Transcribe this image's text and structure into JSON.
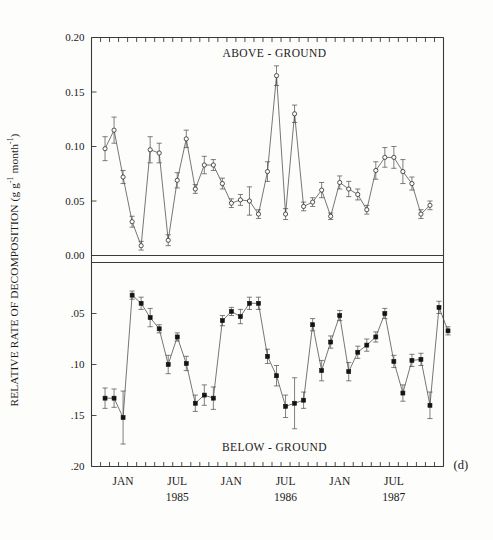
{
  "figure": {
    "panel_label": "(d)",
    "y_axis_title_main": "RELATIVE RATE OF DECOMPOSITION (g g",
    "y_axis_title_sup1": "-1",
    "y_axis_title_mid": " month",
    "y_axis_title_sup2": "-1",
    "y_axis_title_end": ")"
  },
  "chart_data": {
    "type": "line",
    "title": "",
    "xlabel": "",
    "ylabel": "RELATIVE RATE OF DECOMPOSITION (g g-1 month-1)",
    "grid": false,
    "legend": "none",
    "x_axis": {
      "tick_interval": "month",
      "start": "1984-10",
      "end": "1987-12",
      "labeled_ticks": [
        {
          "label": "JAN",
          "date": "1985-01"
        },
        {
          "label": "JUL",
          "date": "1985-07"
        },
        {
          "label": "JAN",
          "date": "1986-01"
        },
        {
          "label": "JUL",
          "date": "1986-07"
        },
        {
          "label": "JAN",
          "date": "1987-01"
        },
        {
          "label": "JUL",
          "date": "1987-07"
        }
      ],
      "year_labels": [
        {
          "label": "1985",
          "date": "1985-07"
        },
        {
          "label": "1986",
          "date": "1986-07"
        },
        {
          "label": "1987",
          "date": "1987-07"
        }
      ]
    },
    "panels": [
      {
        "name": "above-ground",
        "title": "ABOVE - GROUND",
        "marker": "open-circle",
        "ylim": [
          0.0,
          0.2
        ],
        "direction": "up",
        "ytick_labels": [
          "0.00",
          "0.05",
          "0.10",
          "0.15",
          "0.20"
        ],
        "ytick_values": [
          0.0,
          0.05,
          0.1,
          0.15,
          0.2
        ],
        "points": [
          {
            "x": "1984-11",
            "y": 0.098,
            "err": 0.011
          },
          {
            "x": "1984-12",
            "y": 0.115,
            "err": 0.012
          },
          {
            "x": "1985-01",
            "y": 0.072,
            "err": 0.006
          },
          {
            "x": "1985-02",
            "y": 0.031,
            "err": 0.005
          },
          {
            "x": "1985-03",
            "y": 0.009,
            "err": 0.004
          },
          {
            "x": "1985-04",
            "y": 0.097,
            "err": 0.012
          },
          {
            "x": "1985-05",
            "y": 0.094,
            "err": 0.009
          },
          {
            "x": "1985-06",
            "y": 0.014,
            "err": 0.005
          },
          {
            "x": "1985-07",
            "y": 0.069,
            "err": 0.007
          },
          {
            "x": "1985-08",
            "y": 0.107,
            "err": 0.008
          },
          {
            "x": "1985-09",
            "y": 0.061,
            "err": 0.004
          },
          {
            "x": "1985-10",
            "y": 0.083,
            "err": 0.008
          },
          {
            "x": "1985-11",
            "y": 0.083,
            "err": 0.005
          },
          {
            "x": "1985-12",
            "y": 0.066,
            "err": 0.005
          },
          {
            "x": "1986-01",
            "y": 0.048,
            "err": 0.004
          },
          {
            "x": "1986-02",
            "y": 0.051,
            "err": 0.005
          },
          {
            "x": "1986-03",
            "y": 0.05,
            "err": 0.013
          },
          {
            "x": "1986-04",
            "y": 0.038,
            "err": 0.004
          },
          {
            "x": "1986-05",
            "y": 0.077,
            "err": 0.009
          },
          {
            "x": "1986-06",
            "y": 0.165,
            "err": 0.009
          },
          {
            "x": "1986-07",
            "y": 0.038,
            "err": 0.005
          },
          {
            "x": "1986-08",
            "y": 0.13,
            "err": 0.008
          },
          {
            "x": "1986-09",
            "y": 0.045,
            "err": 0.004
          },
          {
            "x": "1986-10",
            "y": 0.049,
            "err": 0.004
          },
          {
            "x": "1986-11",
            "y": 0.06,
            "err": 0.007
          },
          {
            "x": "1986-12",
            "y": 0.036,
            "err": 0.003
          },
          {
            "x": "1987-01",
            "y": 0.067,
            "err": 0.006
          },
          {
            "x": "1987-02",
            "y": 0.061,
            "err": 0.007
          },
          {
            "x": "1987-03",
            "y": 0.056,
            "err": 0.005
          },
          {
            "x": "1987-04",
            "y": 0.042,
            "err": 0.004
          },
          {
            "x": "1987-05",
            "y": 0.078,
            "err": 0.008
          },
          {
            "x": "1987-06",
            "y": 0.09,
            "err": 0.009
          },
          {
            "x": "1987-07",
            "y": 0.09,
            "err": 0.01
          },
          {
            "x": "1987-08",
            "y": 0.077,
            "err": 0.011
          },
          {
            "x": "1987-09",
            "y": 0.066,
            "err": 0.006
          },
          {
            "x": "1987-10",
            "y": 0.038,
            "err": 0.004
          },
          {
            "x": "1987-11",
            "y": 0.046,
            "err": 0.004
          }
        ]
      },
      {
        "name": "below-ground",
        "title": "BELOW - GROUND",
        "marker": "filled-square",
        "ylim": [
          0.0,
          0.2
        ],
        "direction": "down",
        "ytick_labels": [
          "0.00",
          ".05",
          ".10",
          ".15",
          ".20"
        ],
        "ytick_values": [
          0.0,
          0.05,
          0.1,
          0.15,
          0.2
        ],
        "points": [
          {
            "x": "1984-11",
            "y": 0.133,
            "err": 0.01
          },
          {
            "x": "1984-12",
            "y": 0.133,
            "err": 0.009
          },
          {
            "x": "1985-01",
            "y": 0.152,
            "err": 0.026
          },
          {
            "x": "1985-02",
            "y": 0.032,
            "err": 0.004
          },
          {
            "x": "1985-03",
            "y": 0.04,
            "err": 0.006
          },
          {
            "x": "1985-04",
            "y": 0.054,
            "err": 0.009
          },
          {
            "x": "1985-05",
            "y": 0.065,
            "err": 0.004
          },
          {
            "x": "1985-06",
            "y": 0.1,
            "err": 0.009
          },
          {
            "x": "1985-07",
            "y": 0.073,
            "err": 0.004
          },
          {
            "x": "1985-08",
            "y": 0.099,
            "err": 0.007
          },
          {
            "x": "1985-09",
            "y": 0.138,
            "err": 0.008
          },
          {
            "x": "1985-10",
            "y": 0.13,
            "err": 0.01
          },
          {
            "x": "1985-11",
            "y": 0.133,
            "err": 0.011
          },
          {
            "x": "1985-12",
            "y": 0.057,
            "err": 0.005
          },
          {
            "x": "1986-01",
            "y": 0.048,
            "err": 0.004
          },
          {
            "x": "1986-02",
            "y": 0.053,
            "err": 0.007
          },
          {
            "x": "1986-03",
            "y": 0.04,
            "err": 0.006
          },
          {
            "x": "1986-04",
            "y": 0.04,
            "err": 0.006
          },
          {
            "x": "1986-05",
            "y": 0.092,
            "err": 0.007
          },
          {
            "x": "1986-06",
            "y": 0.111,
            "err": 0.01
          },
          {
            "x": "1986-07",
            "y": 0.141,
            "err": 0.011
          },
          {
            "x": "1986-08",
            "y": 0.138,
            "err": 0.025
          },
          {
            "x": "1986-09",
            "y": 0.135,
            "err": 0.008
          },
          {
            "x": "1986-10",
            "y": 0.061,
            "err": 0.006
          },
          {
            "x": "1986-11",
            "y": 0.106,
            "err": 0.01
          },
          {
            "x": "1986-12",
            "y": 0.078,
            "err": 0.006
          },
          {
            "x": "1987-01",
            "y": 0.052,
            "err": 0.005
          },
          {
            "x": "1987-02",
            "y": 0.107,
            "err": 0.009
          },
          {
            "x": "1987-03",
            "y": 0.088,
            "err": 0.006
          },
          {
            "x": "1987-04",
            "y": 0.081,
            "err": 0.006
          },
          {
            "x": "1987-05",
            "y": 0.073,
            "err": 0.005
          },
          {
            "x": "1987-06",
            "y": 0.05,
            "err": 0.005
          },
          {
            "x": "1987-07",
            "y": 0.097,
            "err": 0.006
          },
          {
            "x": "1987-08",
            "y": 0.128,
            "err": 0.008
          },
          {
            "x": "1987-09",
            "y": 0.096,
            "err": 0.006
          },
          {
            "x": "1987-10",
            "y": 0.095,
            "err": 0.006
          },
          {
            "x": "1987-11",
            "y": 0.14,
            "err": 0.013
          },
          {
            "x": "1987-12",
            "y": 0.044,
            "err": 0.006
          },
          {
            "x": "1988-01",
            "y": 0.067,
            "err": 0.004
          }
        ]
      }
    ]
  }
}
